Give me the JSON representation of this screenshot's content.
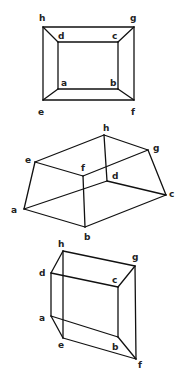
{
  "colors": {
    "line": "#111111",
    "label": "#222222",
    "background": "#ffffff"
  },
  "figures": [
    {
      "name": "figure-1-frustum-top-view",
      "vertices": {
        "h": [
          43,
          27
        ],
        "g": [
          134,
          27
        ],
        "e": [
          43,
          100
        ],
        "f": [
          134,
          100
        ],
        "d": [
          58,
          42
        ],
        "c": [
          118,
          42
        ],
        "a": [
          58,
          89
        ],
        "b": [
          118,
          89
        ]
      },
      "edges": [
        [
          "h",
          "g"
        ],
        [
          "g",
          "f"
        ],
        [
          "f",
          "e"
        ],
        [
          "e",
          "h"
        ],
        [
          "d",
          "c"
        ],
        [
          "c",
          "b"
        ],
        [
          "b",
          "a"
        ],
        [
          "a",
          "d"
        ],
        [
          "h",
          "d"
        ],
        [
          "g",
          "c"
        ],
        [
          "f",
          "b"
        ],
        [
          "e",
          "a"
        ]
      ],
      "labels": {
        "h": {
          "text": "h",
          "pos": [
            39,
            21
          ]
        },
        "g": {
          "text": "g",
          "pos": [
            130,
            21
          ]
        },
        "d": {
          "text": "d",
          "pos": [
            58,
            39
          ]
        },
        "c": {
          "text": "c",
          "pos": [
            112,
            39
          ]
        },
        "a": {
          "text": "a",
          "pos": [
            61,
            86
          ]
        },
        "b": {
          "text": "b",
          "pos": [
            110,
            86
          ]
        },
        "e": {
          "text": "e",
          "pos": [
            38,
            115
          ]
        },
        "f": {
          "text": "f",
          "pos": [
            131,
            115
          ]
        }
      }
    },
    {
      "name": "figure-2-frustum-oblique",
      "vertices": {
        "h": [
          104,
          135
        ],
        "g": [
          148,
          150
        ],
        "e": [
          35,
          162
        ],
        "f": [
          83,
          176
        ],
        "d": [
          107,
          181
        ],
        "c": [
          166,
          195
        ],
        "a": [
          24,
          209
        ],
        "b": [
          85,
          227
        ]
      },
      "edges": [
        [
          "e",
          "h"
        ],
        [
          "h",
          "g"
        ],
        [
          "g",
          "f"
        ],
        [
          "f",
          "e"
        ],
        [
          "a",
          "b"
        ],
        [
          "b",
          "c"
        ],
        [
          "c",
          "d"
        ],
        [
          "d",
          "a"
        ],
        [
          "e",
          "a"
        ],
        [
          "f",
          "b"
        ],
        [
          "g",
          "c"
        ],
        [
          "h",
          "d"
        ]
      ],
      "labels": {
        "h": {
          "text": "h",
          "pos": [
            103,
            131
          ]
        },
        "g": {
          "text": "g",
          "pos": [
            153,
            151
          ]
        },
        "e": {
          "text": "e",
          "pos": [
            25,
            163
          ]
        },
        "f": {
          "text": "f",
          "pos": [
            81,
            171
          ]
        },
        "d": {
          "text": "d",
          "pos": [
            112,
            179
          ]
        },
        "c": {
          "text": "c",
          "pos": [
            169,
            197
          ]
        },
        "a": {
          "text": "a",
          "pos": [
            11,
            213
          ]
        },
        "b": {
          "text": "b",
          "pos": [
            84,
            240
          ]
        }
      }
    },
    {
      "name": "figure-3-prism-side-view",
      "vertices": {
        "h": [
          63,
          251
        ],
        "g": [
          135,
          266
        ],
        "d": [
          51,
          273
        ],
        "c": [
          118,
          287
        ],
        "a": [
          51,
          316
        ],
        "e": [
          63,
          338
        ],
        "b": [
          118,
          337
        ],
        "f": [
          136,
          359
        ]
      },
      "edges": [
        [
          "h",
          "g"
        ],
        [
          "d",
          "c"
        ],
        [
          "h",
          "d"
        ],
        [
          "g",
          "c"
        ],
        [
          "d",
          "a"
        ],
        [
          "c",
          "b"
        ],
        [
          "a",
          "b"
        ],
        [
          "h",
          "e"
        ],
        [
          "g",
          "f"
        ],
        [
          "e",
          "f"
        ],
        [
          "a",
          "e"
        ],
        [
          "b",
          "f"
        ]
      ],
      "labels": {
        "h": {
          "text": "h",
          "pos": [
            58,
            247
          ]
        },
        "g": {
          "text": "g",
          "pos": [
            132,
            260
          ]
        },
        "d": {
          "text": "d",
          "pos": [
            39,
            276
          ]
        },
        "c": {
          "text": "c",
          "pos": [
            112,
            283
          ]
        },
        "a": {
          "text": "a",
          "pos": [
            39,
            321
          ]
        },
        "e": {
          "text": "e",
          "pos": [
            58,
            348
          ]
        },
        "b": {
          "text": "b",
          "pos": [
            112,
            350
          ]
        },
        "f": {
          "text": "f",
          "pos": [
            138,
            368
          ]
        }
      }
    }
  ]
}
